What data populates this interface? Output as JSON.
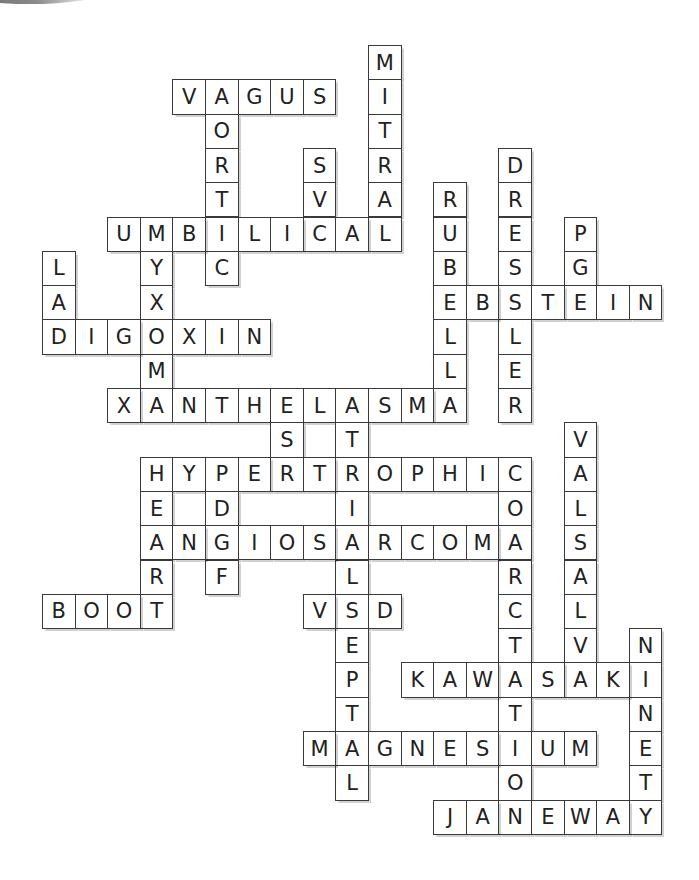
{
  "puzzle": {
    "type": "crossword-solution",
    "grid": {
      "origin_x": 42,
      "origin_y": 45,
      "col_pitch": 32.6,
      "row_pitch": 34.3
    },
    "colors": {
      "border": "#3a3a3a",
      "letter": "#222222",
      "background": "#ffffff"
    },
    "words": [
      {
        "answer": "MITRAL",
        "row": 0,
        "col": 10,
        "dir": "down"
      },
      {
        "answer": "VAGUS",
        "row": 1,
        "col": 4,
        "dir": "across"
      },
      {
        "answer": "AORTIC",
        "row": 1,
        "col": 5,
        "dir": "down"
      },
      {
        "answer": "SVC",
        "row": 3,
        "col": 8,
        "dir": "down"
      },
      {
        "answer": "DRESSLER",
        "row": 3,
        "col": 14,
        "dir": "down"
      },
      {
        "answer": "RUBELLA",
        "row": 4,
        "col": 12,
        "dir": "down"
      },
      {
        "answer": "UMBILICAL",
        "row": 5,
        "col": 2,
        "dir": "across"
      },
      {
        "answer": "PGE",
        "row": 5,
        "col": 16,
        "dir": "down"
      },
      {
        "answer": "MYXOMA",
        "row": 5,
        "col": 3,
        "dir": "down"
      },
      {
        "answer": "LAD",
        "row": 6,
        "col": 0,
        "dir": "down"
      },
      {
        "answer": "EBSTEIN",
        "row": 7,
        "col": 12,
        "dir": "across"
      },
      {
        "answer": "DIGOXIN",
        "row": 8,
        "col": 0,
        "dir": "across"
      },
      {
        "answer": "XANTHELASMA",
        "row": 10,
        "col": 2,
        "dir": "across"
      },
      {
        "answer": "ESR",
        "row": 10,
        "col": 7,
        "dir": "down"
      },
      {
        "answer": "ATRIALSEPTAL",
        "row": 10,
        "col": 9,
        "dir": "down"
      },
      {
        "answer": "VALSALVA",
        "row": 11,
        "col": 16,
        "dir": "down"
      },
      {
        "answer": "HYPERTROPHIC",
        "row": 12,
        "col": 3,
        "dir": "across"
      },
      {
        "answer": "HEART",
        "row": 12,
        "col": 3,
        "dir": "down"
      },
      {
        "answer": "PDGF",
        "row": 12,
        "col": 5,
        "dir": "down"
      },
      {
        "answer": "COARCTATION",
        "row": 12,
        "col": 14,
        "dir": "down"
      },
      {
        "answer": "ANGIOSARCOMA",
        "row": 14,
        "col": 3,
        "dir": "across"
      },
      {
        "answer": "BOOT",
        "row": 16,
        "col": 0,
        "dir": "across"
      },
      {
        "answer": "VSD",
        "row": 16,
        "col": 8,
        "dir": "across"
      },
      {
        "answer": "NINETY",
        "row": 17,
        "col": 18,
        "dir": "down"
      },
      {
        "answer": "KAWASAKI",
        "row": 18,
        "col": 11,
        "dir": "across"
      },
      {
        "answer": "MAGNESIUM",
        "row": 20,
        "col": 8,
        "dir": "across"
      },
      {
        "answer": "JANEWAY",
        "row": 22,
        "col": 12,
        "dir": "across"
      }
    ]
  }
}
